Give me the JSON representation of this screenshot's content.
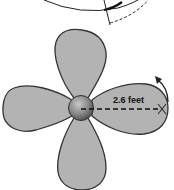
{
  "diagram": {
    "radius_label": "2.6 feet",
    "radius_value": 2.6,
    "radius_unit": "feet",
    "blade_count": 4,
    "colors": {
      "blade_fill": "#b3b3b3",
      "blade_stroke": "#333333",
      "hub_fill": "#8a8a8a",
      "line": "#111111",
      "background": "#ffffff"
    },
    "elements": {
      "top_fragment": "partial circle with dashed arc (previous figure)",
      "fan": "four-blade fan with central hub",
      "radius_line": "dashed line from hub center to blade tip",
      "rotation_arrow": "curved arrow at blade tip indicating counterclockwise rotation"
    }
  }
}
